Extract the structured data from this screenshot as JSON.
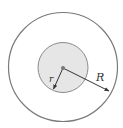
{
  "diagram": {
    "labels": {
      "inner_radius": "r",
      "outer_radius": "R"
    },
    "colors": {
      "outer_stroke": "#7a7a7a",
      "inner_fill": "#e6e6e6",
      "inner_stroke": "#8a8a8a",
      "arrow": "#333333",
      "center_dot": "#777777"
    }
  }
}
